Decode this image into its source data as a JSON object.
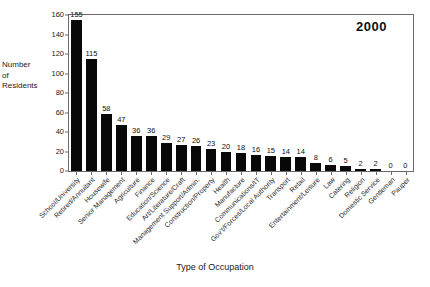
{
  "chart_data": {
    "type": "bar",
    "title": "",
    "annotation": "2000",
    "xlabel": "Type of Occupation",
    "ylabel": "Number\nof\nResidents",
    "ylim": [
      0,
      160
    ],
    "yticks": [
      0,
      20,
      40,
      60,
      80,
      100,
      120,
      140,
      160
    ],
    "grid": false,
    "legend": "none",
    "bar_color": "#080808",
    "categories": [
      "School/University",
      "Retired/Annuitant",
      "Housewife",
      "Senior Management",
      "Agriculture",
      "Finance",
      "Education/Science",
      "Art/Literature/Craft",
      "Management Support/Admin.",
      "Construction/Property",
      "Health",
      "Manufacture",
      "Communications/IT",
      "Gov't/Forces/Local Authority",
      "Transport",
      "Retail",
      "Entertainment/Leisure",
      "Law",
      "Catering",
      "Religion",
      "Domestic Service",
      "Gentleman",
      "Pauper"
    ],
    "values": [
      155,
      115,
      58,
      47,
      36,
      36,
      29,
      27,
      26,
      23,
      20,
      18,
      16,
      15,
      14,
      14,
      8,
      6,
      5,
      2,
      2,
      0,
      0
    ]
  }
}
